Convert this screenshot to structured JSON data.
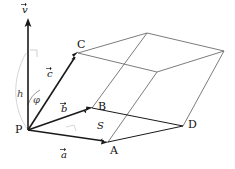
{
  "figure": {
    "stroke_color": "#1a1a1a",
    "thin_stroke_color": "#5a5a5a",
    "background": "#ffffff"
  },
  "points": {
    "P": {
      "label": "P",
      "x": 28,
      "y": 130
    },
    "A": {
      "label": "A",
      "x": 108,
      "y": 142
    },
    "B": {
      "label": "B",
      "x": 92,
      "y": 108
    },
    "C": {
      "label": "C",
      "x": 78,
      "y": 53
    },
    "D": {
      "label": "D",
      "x": 183,
      "y": 126
    }
  },
  "vectors": {
    "a": {
      "label": "a",
      "tail": "P",
      "head": "A"
    },
    "b": {
      "label": "b",
      "tail": "P",
      "head": "B"
    },
    "c": {
      "label": "c",
      "tail": "P",
      "head": "C"
    },
    "v": {
      "label": "v",
      "note": "normal vector, vertical"
    }
  },
  "annotations": {
    "height": {
      "label": "h"
    },
    "angle": {
      "label": "φ"
    },
    "area": {
      "label": "S"
    }
  }
}
